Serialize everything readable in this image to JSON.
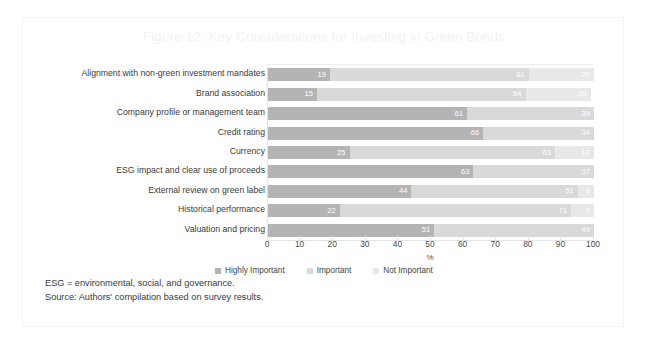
{
  "figure": {
    "title": "Figure 12: Key Considerations for Investing in Green Bonds",
    "notes": [
      "ESG = environmental, social, and governance.",
      "Source: Authors' compilation based on survey results."
    ]
  },
  "colors": {
    "highly_important": "#b4b4b4",
    "important": "#d9d9d9",
    "not_important": "#e8e8e8",
    "title": "#f2f2f2",
    "text": "#3a3a3a",
    "axis": "#e2e2e2"
  },
  "chart_data": {
    "type": "bar",
    "orientation": "horizontal",
    "stacked": true,
    "title": "Figure 12: Key Considerations for Investing in Green Bonds",
    "xlabel": "%",
    "ylabel": "",
    "xlim": [
      0,
      100
    ],
    "xticks": [
      0,
      10,
      20,
      30,
      40,
      50,
      60,
      70,
      80,
      90,
      100
    ],
    "grid": false,
    "legend_position": "bottom",
    "categories": [
      "Alignment with non-green investment mandates",
      "Brand association",
      "Company profile or management team",
      "Credit rating",
      "Currency",
      "ESG impact and clear use of proceeds",
      "External review on green label",
      "Historical performance",
      "Valuation and pricing"
    ],
    "series": [
      {
        "name": "Highly Important",
        "color": "#b4b4b4",
        "values": [
          19,
          15,
          61,
          66,
          25,
          63,
          44,
          22,
          51
        ]
      },
      {
        "name": "Important",
        "color": "#d9d9d9",
        "values": [
          61,
          64,
          39,
          34,
          63,
          37,
          51,
          71,
          49
        ]
      },
      {
        "name": "Not Important",
        "color": "#e8e8e8",
        "values": [
          20,
          20,
          0,
          0,
          12,
          0,
          5,
          7,
          0
        ]
      }
    ]
  }
}
